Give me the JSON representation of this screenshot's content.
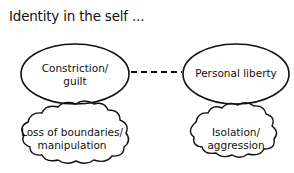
{
  "title": "Identity in the self ...",
  "nodes": {
    "constriction": {
      "label_line1": "Constriction/",
      "label_line2": "guilt"
    },
    "liberty": {
      "label": "Personal liberty"
    },
    "boundaries": {
      "label_line1": "Loss of boundaries/",
      "label_line2": "manipulation"
    },
    "isolation": {
      "label_line1": "Isolation/",
      "label_line2": "aggression"
    }
  },
  "connector": {
    "style": "dashed",
    "from": "constriction",
    "to": "liberty"
  }
}
